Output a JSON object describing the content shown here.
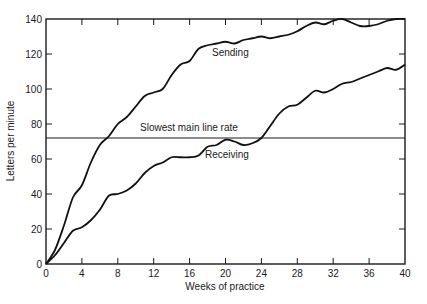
{
  "chart_data": {
    "type": "line",
    "title": "",
    "xlabel": "Weeks of practice",
    "ylabel": "Letters per minute",
    "xlim": [
      0,
      40
    ],
    "ylim": [
      0,
      140
    ],
    "x_ticks": [
      0,
      4,
      8,
      12,
      16,
      20,
      24,
      28,
      32,
      36,
      40
    ],
    "y_ticks": [
      0,
      20,
      40,
      60,
      80,
      100,
      120,
      140
    ],
    "grid": false,
    "legend": "none (inline labels)",
    "x": [
      0,
      1,
      2,
      3,
      4,
      5,
      6,
      7,
      8,
      9,
      10,
      11,
      12,
      13,
      14,
      15,
      16,
      17,
      18,
      19,
      20,
      21,
      22,
      23,
      24,
      25,
      26,
      27,
      28,
      29,
      30,
      31,
      32,
      33,
      34,
      35,
      36,
      37,
      38,
      39,
      40
    ],
    "series": [
      {
        "name": "Sending",
        "values": [
          0,
          8,
          22,
          38,
          45,
          58,
          68,
          73,
          80,
          84,
          90,
          96,
          98,
          100,
          108,
          114,
          116,
          123,
          125,
          126,
          127,
          126,
          128,
          129,
          130,
          129,
          130,
          131,
          133,
          136,
          138,
          137,
          139,
          140,
          138,
          136,
          136,
          137,
          139,
          140,
          140
        ]
      },
      {
        "name": "Receiving",
        "values": [
          0,
          5,
          12,
          19,
          21,
          25,
          31,
          39,
          40,
          42,
          46,
          52,
          56,
          58,
          61,
          61,
          61,
          62,
          67,
          68,
          71,
          70,
          68,
          69,
          72,
          79,
          86,
          90,
          91,
          95,
          99,
          98,
          100,
          103,
          104,
          106,
          108,
          110,
          112,
          111,
          114
        ]
      }
    ],
    "reference_lines": [
      {
        "name": "Slowest main line rate",
        "y": 72
      }
    ],
    "annotations": [
      {
        "text": "Sending",
        "x": 21,
        "y": 127
      },
      {
        "text": "Slowest main line rate",
        "x": 13,
        "y": 76
      },
      {
        "text": "Receiving",
        "x": 21,
        "y": 66
      }
    ]
  },
  "labels": {
    "xlabel": "Weeks of practice",
    "ylabel": "Letters per minute",
    "sending": "Sending",
    "receiving": "Receiving",
    "refline": "Slowest main line rate"
  }
}
